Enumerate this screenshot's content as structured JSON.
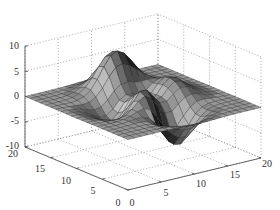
{
  "chart_data": {
    "type": "surface",
    "title": "",
    "xlabel": "",
    "ylabel": "",
    "zlabel": "",
    "function": "peaks",
    "grid_size": 20,
    "x_range": [
      0,
      20
    ],
    "y_range": [
      0,
      20
    ],
    "zlim": [
      -10,
      10
    ],
    "x_ticks": [
      0,
      5,
      10,
      15,
      20
    ],
    "y_ticks": [
      0,
      5,
      10,
      15,
      20
    ],
    "z_ticks": [
      -10,
      -5,
      0,
      5,
      10
    ],
    "x_tick_labels": [
      "0",
      "5",
      "10",
      "15",
      "20"
    ],
    "y_tick_labels": [
      "0",
      "5",
      "10",
      "15",
      "20"
    ],
    "z_tick_labels": [
      "-10",
      "-5",
      "0",
      "5",
      "10"
    ],
    "grid": true,
    "colormap": "gray",
    "z_max_approx": 8.1,
    "z_min_approx": -6.5,
    "view": {
      "azimuth": -37.5,
      "elevation": 30
    }
  },
  "colors": {
    "background": "#ffffff",
    "grid": "#9a9a9a",
    "axis": "#555555",
    "edge": "#2a2a2a",
    "tick_text": "#333333"
  }
}
